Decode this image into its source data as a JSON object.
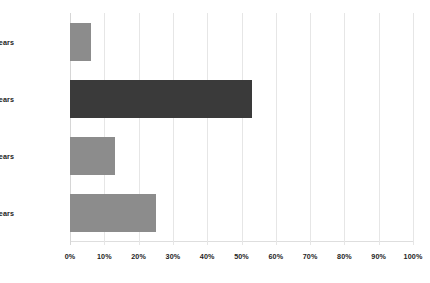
{
  "chart_data": {
    "type": "bar",
    "orientation": "horizontal",
    "title": "",
    "xlabel": "",
    "ylabel": "",
    "categories": [
      "15-18 years",
      "19-22 years",
      "23-26 years",
      "27-30 years"
    ],
    "values": [
      6,
      53,
      13,
      25
    ],
    "value_suffix": "%",
    "xlim": [
      0,
      100
    ],
    "xticks": [
      0,
      10,
      20,
      30,
      40,
      50,
      60,
      70,
      80,
      90,
      100
    ],
    "xtick_labels": [
      "0%",
      "10%",
      "20%",
      "30%",
      "40%",
      "50%",
      "60%",
      "70%",
      "80%",
      "90%",
      "100%"
    ],
    "grid": "vertical",
    "legend": "none",
    "bar_colors": [
      "#8c8c8c",
      "#3a3a3a",
      "#8c8c8c",
      "#8c8c8c"
    ],
    "colors": {
      "background": "#ffffff",
      "gridline": "#e6e6e6",
      "axis": "#d6d6d6",
      "bar_gray": "#8c8c8c",
      "bar_dark": "#3a3a3a",
      "text": "#232323"
    }
  }
}
